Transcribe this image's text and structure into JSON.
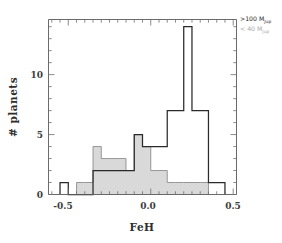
{
  "chart_data": {
    "type": "bar",
    "title": "",
    "xlabel": "FeH",
    "ylabel": "# planets",
    "xlim": [
      -0.62,
      0.52
    ],
    "ylim": [
      0,
      14.6
    ],
    "xticks": [
      -0.5,
      0.0,
      0.5
    ],
    "xtick_labels": [
      "-0.5",
      "0.0",
      "0.5"
    ],
    "yticks": [
      0,
      5,
      10
    ],
    "ytick_labels": [
      "0",
      "5",
      "10"
    ],
    "grid": false,
    "bin_width": 0.05,
    "legend_position": "top-right",
    "series": [
      {
        "name": ">100 MJup",
        "style": "step-outline",
        "color": "#2a2a2a",
        "bin_edges": [
          -0.55,
          -0.5,
          -0.45,
          -0.4,
          -0.35,
          -0.3,
          -0.25,
          -0.2,
          -0.15,
          -0.1,
          -0.05,
          0.0,
          0.05,
          0.1,
          0.15,
          0.2,
          0.25,
          0.3,
          0.35,
          0.4,
          0.45
        ],
        "values": [
          1,
          0,
          0,
          0,
          2,
          2,
          2,
          2,
          2,
          5,
          4,
          4,
          4,
          7,
          7,
          14,
          7,
          7,
          1,
          1
        ]
      },
      {
        "name": "< 40 MJup",
        "style": "step-filled",
        "color": "#d9d9d9",
        "edge_color": "#8c8c8c",
        "bin_edges": [
          -0.45,
          -0.4,
          -0.35,
          -0.3,
          -0.25,
          -0.2,
          -0.15,
          -0.1,
          -0.05,
          0.0,
          0.05,
          0.1,
          0.15,
          0.2,
          0.25,
          0.3,
          0.35
        ],
        "values": [
          1,
          1,
          4,
          3,
          3,
          3,
          2,
          5,
          4,
          2,
          2,
          1,
          1,
          1,
          1,
          1
        ]
      }
    ]
  },
  "axes": {
    "x_label": "FeH",
    "y_label": "# planets",
    "x_tick_0": "-0.5",
    "x_tick_1": "0.0",
    "x_tick_2": "0.5",
    "y_tick_0": "0",
    "y_tick_1": "5",
    "y_tick_2": "10"
  },
  "legend": {
    "entry_high_prefix": ">100 M",
    "entry_high_sub": "Jup",
    "entry_low_prefix": "< 40 M",
    "entry_low_sub": "Jup",
    "color_high": "#2b2b2b",
    "color_low": "#a8a8a8"
  }
}
